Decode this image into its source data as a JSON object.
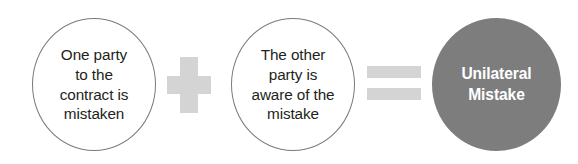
{
  "diagram": {
    "type": "equation-diagram",
    "colors": {
      "result_fill": "#7d7d7d",
      "result_text": "#ffffff",
      "operator": "#d4d4d4",
      "circle_outline": "#7a7a7a",
      "circle_text": "#231f20",
      "background": "#ffffff"
    },
    "nodes": [
      {
        "id": "condition-1",
        "shape": "circle-outline",
        "text": "One party\nto the\ncontract is\nmistaken"
      },
      {
        "id": "condition-2",
        "shape": "circle-outline",
        "text": "The other\nparty is\naware of the\nmistake"
      },
      {
        "id": "result",
        "shape": "circle-filled",
        "text": "Unilateral\nMistake"
      }
    ],
    "operators": [
      {
        "id": "plus",
        "symbol": "+",
        "name": "plus-operator"
      },
      {
        "id": "equals",
        "symbol": "=",
        "name": "equals-operator"
      }
    ]
  }
}
